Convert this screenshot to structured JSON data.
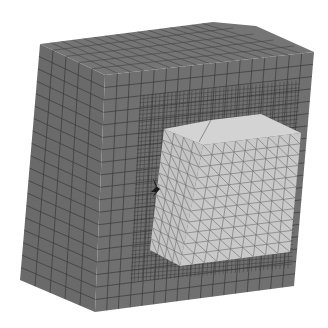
{
  "scene": {
    "description": "3D finite element mesh: outer hexahedral-meshed block with embedded tetrahedral-meshed cube",
    "background": "#ffffff",
    "outer_block": {
      "label": "outer-block",
      "mesh_type": "hexahedral",
      "face_color_left": "#6a6a6a",
      "face_color_front": "#707070",
      "face_color_top": "#747474",
      "line_color": "#3a3a3a",
      "vertices": {
        "top_left": [
          40,
          44
        ],
        "top_back": [
          213,
          22
        ],
        "top_back_right": [
          256,
          26
        ],
        "top_right": [
          314,
          52
        ],
        "top_front": [
          105,
          75
        ],
        "bottom_left": [
          20,
          280
        ],
        "bottom_front": [
          95,
          312
        ],
        "bottom_right": [
          294,
          286
        ]
      }
    },
    "inner_cube": {
      "label": "inner-cube",
      "mesh_type": "tetrahedral",
      "face_color_front": "#c9c9c9",
      "face_color_left": "#c4c4c4",
      "face_color_top": "#d2d2d2",
      "line_color": "#6c6c6c",
      "vertices": {
        "top_left": [
          164,
          129
        ],
        "top_back": [
          211,
          120
        ],
        "top_back_right": [
          261,
          114
        ],
        "top_right": [
          301,
          133
        ],
        "top_front": [
          203,
          145
        ],
        "bottom_left": [
          150,
          250
        ],
        "bottom_front": [
          180,
          266
        ],
        "bottom_right": [
          290,
          252
        ]
      }
    },
    "marker": {
      "label": "constraint-marker",
      "color": "#1a1a1a",
      "position": [
        155,
        186
      ]
    }
  }
}
